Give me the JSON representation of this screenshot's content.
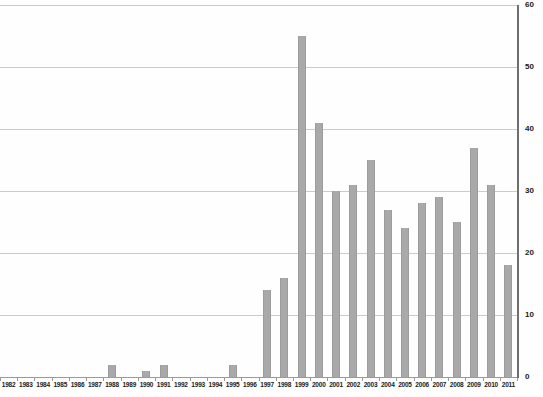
{
  "chart_data": {
    "type": "bar",
    "title": "",
    "xlabel": "",
    "ylabel": "",
    "categories": [
      "1982",
      "1983",
      "1984",
      "1985",
      "1986",
      "1987",
      "1988",
      "1989",
      "1990",
      "1991",
      "1992",
      "1993",
      "1994",
      "1995",
      "1996",
      "1997",
      "1998",
      "1999",
      "2000",
      "2001",
      "2002",
      "2003",
      "2004",
      "2005",
      "2006",
      "2007",
      "2008",
      "2009",
      "2010",
      "2011"
    ],
    "values": [
      0,
      0,
      0,
      0,
      0,
      0,
      2,
      0,
      1,
      2,
      0,
      0,
      0,
      2,
      0,
      14,
      16,
      55,
      41,
      30,
      31,
      35,
      27,
      24,
      28,
      29,
      25,
      37,
      31,
      18
    ],
    "ylim": [
      0,
      60
    ],
    "yticks": [
      0,
      10,
      20,
      30,
      40,
      50,
      60
    ],
    "y_axis_side": "right",
    "grid": true,
    "legend": null,
    "colors": {
      "bar_fill": "#a9a9a9",
      "bar_edge": "#9c9c9c",
      "gridline": "#cbcbcb",
      "x_axis_line": "#9a9a9a",
      "y_axis_line": "#6e6e6e",
      "tick": "#9a9a9a",
      "label_text": "#1a1a1a",
      "background": "#fefefe"
    }
  }
}
